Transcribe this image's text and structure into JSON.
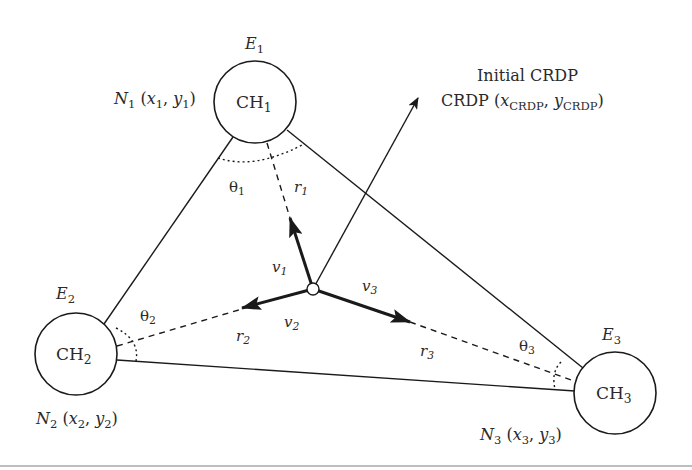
{
  "diagram": {
    "nodes": [
      {
        "id": "CH1",
        "name_base": "CH",
        "name_sub": "1",
        "energy_base": "E",
        "energy_sub": "1",
        "position_label": {
          "N": "N",
          "N_sub": "1",
          "x": "x",
          "x_sub": "1",
          "y": "y",
          "y_sub": "1"
        },
        "angle_base": "θ",
        "angle_sub": "1",
        "dist_base": "r",
        "dist_sub": "1",
        "vector_base": "v",
        "vector_sub": "1"
      },
      {
        "id": "CH2",
        "name_base": "CH",
        "name_sub": "2",
        "energy_base": "E",
        "energy_sub": "2",
        "position_label": {
          "N": "N",
          "N_sub": "2",
          "x": "x",
          "x_sub": "2",
          "y": "y",
          "y_sub": "2"
        },
        "angle_base": "θ",
        "angle_sub": "2",
        "dist_base": "r",
        "dist_sub": "2",
        "vector_base": "v",
        "vector_sub": "2"
      },
      {
        "id": "CH3",
        "name_base": "CH",
        "name_sub": "3",
        "energy_base": "E",
        "energy_sub": "3",
        "position_label": {
          "N": "N",
          "N_sub": "3",
          "x": "x",
          "x_sub": "3",
          "y": "y",
          "y_sub": "3"
        },
        "angle_base": "θ",
        "angle_sub": "3",
        "dist_base": "r",
        "dist_sub": "3",
        "vector_base": "v",
        "vector_sub": "3"
      }
    ],
    "crdp": {
      "title": "Initial CRDP",
      "label_prefix": "CRDP (",
      "x": "x",
      "x_sub": "CRDP",
      "sep": ", ",
      "y": "y",
      "y_sub": "CRDP",
      "label_suffix": ")"
    },
    "punct": {
      "open": " (",
      "comma": ", ",
      "close": ")"
    },
    "colors": {
      "stroke": "#1a1a1a",
      "text": "#2a2a2a",
      "rule": "#bdbdbd",
      "background": "#ffffff"
    }
  }
}
